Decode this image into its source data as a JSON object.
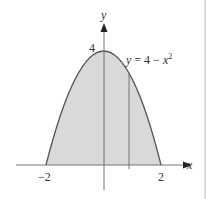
{
  "figure": {
    "type": "function-area-diagram",
    "equation_label": "y = 4 − x²",
    "equation_parts": {
      "lhs": "y",
      "rhs_const": "4 − ",
      "rhs_var": "x",
      "rhs_exp": "2"
    },
    "axis_labels": {
      "x": "x",
      "y": "y"
    },
    "tick_labels": {
      "x_left": "−2",
      "x_right": "2",
      "y_top": "4"
    },
    "function": "y = 4 - x^2",
    "shaded_region": {
      "x_from": -2,
      "x_to": 2,
      "fill": "#d9d9d9"
    },
    "vertical_strip_x": 0.87,
    "colors": {
      "curve": "#555555",
      "axis": "#444444",
      "fill": "#d9d9d9",
      "border": "#bbbbbb"
    }
  }
}
